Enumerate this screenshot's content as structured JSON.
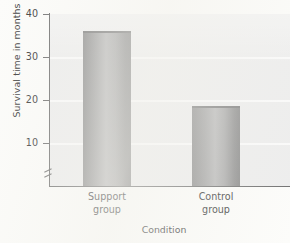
{
  "chart_data": {
    "type": "bar",
    "title": "",
    "xlabel": "Condition",
    "ylabel": "Survival time in months",
    "categories": [
      "Support group",
      "Control group"
    ],
    "category_lines": [
      {
        "line1": "Support",
        "line2": "group"
      },
      {
        "line1": "Control",
        "line2": "group"
      }
    ],
    "values": [
      36,
      18.5
    ],
    "ylim": [
      0,
      40
    ],
    "yticks": [
      10,
      20,
      30,
      40
    ],
    "ytick_labels": [
      "10",
      "20",
      "30",
      "40"
    ],
    "grid": true,
    "grid_axis": "y",
    "legend": "none",
    "axis_break": true,
    "colors": {
      "bar_edge": "#8e8e8e",
      "bar_center": "#b9b9b9",
      "bar_top_edge": "#7e7e7e",
      "plot_background": "#ededed",
      "gridline": "#fafafa",
      "axis": "#6f6f6f",
      "page_background": "#fcfcfa",
      "text": "#3a3a3a"
    }
  }
}
